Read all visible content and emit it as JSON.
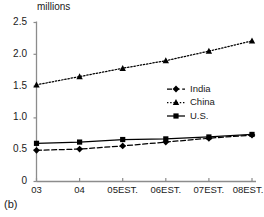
{
  "caption": "(b)",
  "chart_data": {
    "type": "line",
    "title": "",
    "subtitle": "",
    "xlabel": "",
    "ylabel": "millions",
    "unit_label": "millions",
    "categories": [
      "03",
      "04",
      "05EST.",
      "06EST.",
      "07EST.",
      "08EST."
    ],
    "yticks": [
      "0",
      "0.5",
      "1.0",
      "1.5",
      "2.0",
      "2.5"
    ],
    "ytick_values": [
      0,
      0.5,
      1.0,
      1.5,
      2.0,
      2.5
    ],
    "ylim": [
      0,
      2.5
    ],
    "grid": false,
    "legend_position": "center-right",
    "series": [
      {
        "name": "India",
        "values": [
          0.49,
          0.51,
          0.56,
          0.62,
          0.68,
          0.73
        ],
        "marker": "diamond",
        "line_style": "dashed",
        "color": "#000000"
      },
      {
        "name": "China",
        "values": [
          1.52,
          1.65,
          1.78,
          1.9,
          2.05,
          2.21
        ],
        "marker": "triangle",
        "line_style": "dotted",
        "color": "#000000"
      },
      {
        "name": "U.S.",
        "values": [
          0.6,
          0.62,
          0.66,
          0.67,
          0.7,
          0.74
        ],
        "marker": "square",
        "line_style": "solid",
        "color": "#000000"
      }
    ]
  },
  "colors": {
    "axis": "#8c8c8c",
    "series": "#000000",
    "text": "#1a1a1a",
    "background": "#ffffff"
  }
}
